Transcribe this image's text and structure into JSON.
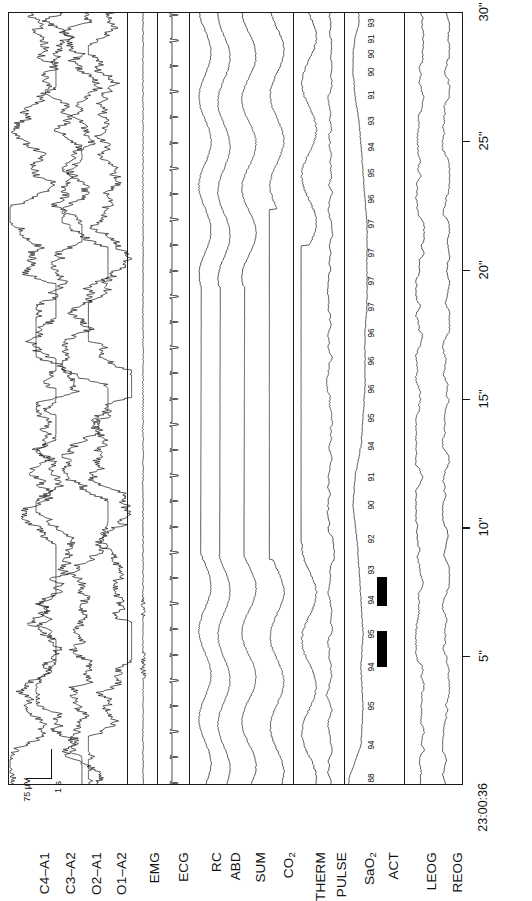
{
  "recording": {
    "start_time": "23:00:36",
    "epoch_duration_label": "30\"",
    "calibration_amplitude": "75 µV",
    "calibration_time": "1 s"
  },
  "time_axis": {
    "unit_suffix": "\"",
    "start_label": "23:00:36",
    "ticks": [
      "5\"",
      "10\"",
      "15\"",
      "20\"",
      "25\"",
      "30\""
    ],
    "tick_seconds": [
      5,
      10,
      15,
      20,
      25,
      30
    ],
    "range_seconds": [
      0,
      30
    ]
  },
  "channels": [
    {
      "id": "c4a1",
      "label": "C4–A1",
      "type": "eeg",
      "group": "eeg"
    },
    {
      "id": "c3a2",
      "label": "C3–A2",
      "type": "eeg",
      "group": "eeg"
    },
    {
      "id": "o2a1",
      "label": "O2–A1",
      "type": "eeg",
      "group": "eeg"
    },
    {
      "id": "o1a2",
      "label": "O1–A2",
      "type": "eeg",
      "group": "eeg"
    },
    {
      "id": "emg",
      "label": "EMG",
      "type": "emg",
      "group": "emg"
    },
    {
      "id": "ecg",
      "label": "ECG",
      "type": "ecg",
      "group": "ecg"
    },
    {
      "id": "rc",
      "label": "RC",
      "type": "resp",
      "group": "resp"
    },
    {
      "id": "abd",
      "label": "ABD",
      "type": "resp",
      "group": "resp"
    },
    {
      "id": "sum",
      "label": "SUM",
      "type": "resp",
      "group": "resp"
    },
    {
      "id": "co2",
      "label": "CO₂",
      "type": "resp",
      "group": "resp"
    },
    {
      "id": "therm",
      "label": "THERM",
      "type": "flow",
      "group": "flow"
    },
    {
      "id": "pulse",
      "label": "PULSE",
      "type": "pulse",
      "group": "pulse"
    },
    {
      "id": "sao2",
      "label": "SaO₂",
      "type": "sat",
      "group": "sat"
    },
    {
      "id": "act",
      "label": "ACT",
      "type": "event",
      "group": "event"
    },
    {
      "id": "leog",
      "label": "LEOG",
      "type": "eog",
      "group": "eog"
    },
    {
      "id": "reog",
      "label": "REOG",
      "type": "eog",
      "group": "eog"
    }
  ],
  "chart_data": {
    "type": "line",
    "subtitle": "Obstructive apnea with oxygen desaturation",
    "xlabel": "Time (seconds)",
    "ylabel": "Channel",
    "xlim": [
      0,
      30
    ],
    "grid": false,
    "legend": "none",
    "orientation": "time-vertical-bottom-to-top",
    "sao2_annotations": {
      "label": "SaO₂ (%)",
      "units": "%",
      "values": [
        88,
        94,
        95,
        94,
        95,
        94,
        93,
        92,
        90,
        91,
        94,
        95,
        96,
        96,
        96,
        97,
        97,
        97,
        97,
        96,
        95,
        94,
        93,
        91,
        90,
        90,
        91,
        93
      ],
      "times": [
        0.3,
        1.6,
        3.1,
        4.6,
        5.9,
        7.2,
        8.4,
        9.6,
        10.9,
        12.0,
        13.2,
        14.3,
        15.4,
        16.5,
        17.6,
        18.6,
        19.6,
        20.7,
        21.8,
        22.8,
        23.8,
        24.8,
        25.8,
        26.8,
        27.7,
        28.4,
        29.0,
        29.6
      ],
      "minimum": 88,
      "maximum": 97
    },
    "events": {
      "label": "ACT — body movement / arousal bars",
      "bars": [
        {
          "name": "movement-1",
          "start_seconds": 4.6,
          "end_seconds": 6.0
        },
        {
          "name": "movement-2",
          "start_seconds": 7.0,
          "end_seconds": 8.1
        }
      ]
    },
    "apnea_markers": {
      "label": "Absent airflow / effort (flatline segments)",
      "co2_flat": {
        "start_seconds": 8.8,
        "end_seconds": 22.4
      },
      "therm_flat": {
        "start_seconds": 9.4,
        "end_seconds": 21.0
      },
      "resp_flat": {
        "start_seconds": 9.0,
        "end_seconds": 19.4
      }
    },
    "series": [
      {
        "name": "C4–A1",
        "kind": "eeg",
        "amplitude": 17,
        "note": "high-voltage slow wave activity"
      },
      {
        "name": "C3–A2",
        "kind": "eeg",
        "amplitude": 17,
        "note": "high-voltage slow wave activity"
      },
      {
        "name": "O2–A1",
        "kind": "eeg",
        "amplitude": 17,
        "note": "high-voltage slow wave activity"
      },
      {
        "name": "O1–A2",
        "kind": "eeg",
        "amplitude": 16,
        "note": "high-voltage slow wave activity"
      },
      {
        "name": "EMG",
        "kind": "emg",
        "amplitude": 1.2,
        "note": "low tone, atonia"
      },
      {
        "name": "ECG",
        "kind": "ecg",
        "amplitude": 6,
        "note": "regular QRS, approx 60 bpm"
      },
      {
        "name": "RC",
        "kind": "resp",
        "amplitude": 6,
        "note": "ribcage effort, ceases during apnea"
      },
      {
        "name": "ABD",
        "kind": "resp",
        "amplitude": 6,
        "note": "abdominal effort, ceases during apnea"
      },
      {
        "name": "SUM",
        "kind": "resp",
        "amplitude": 7,
        "note": "summed effort, ceases during apnea"
      },
      {
        "name": "CO₂",
        "kind": "resp",
        "amplitude": 9,
        "note": "end tidal CO2, flat during apnea"
      },
      {
        "name": "THERM",
        "kind": "flow",
        "amplitude": 9,
        "note": "thermistor airflow, flat during apnea"
      },
      {
        "name": "PULSE",
        "kind": "pulse",
        "amplitude": 4,
        "note": "pulse waveform"
      },
      {
        "name": "SaO₂",
        "kind": "sat",
        "amplitude": 3,
        "note": "oxygen saturation trend, nadir 88%"
      },
      {
        "name": "ACT",
        "kind": "event",
        "amplitude": 0,
        "note": "activity event bars"
      },
      {
        "name": "LEOG",
        "kind": "eog",
        "amplitude": 4,
        "note": "left eye movement"
      },
      {
        "name": "REOG",
        "kind": "eog",
        "amplitude": 3.5,
        "note": "right eye movement"
      }
    ]
  },
  "colors": {
    "trace": "#1a1a1a",
    "frame": "#1a1a1a",
    "event_bar": "#000000",
    "background": "#ffffff"
  }
}
